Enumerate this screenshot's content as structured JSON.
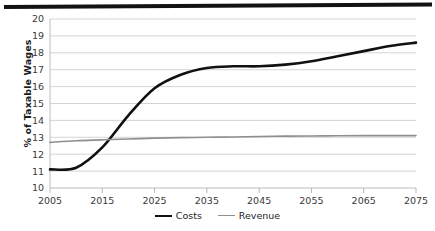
{
  "chart_data": {
    "type": "line",
    "title": "",
    "xlabel": "",
    "ylabel": "% of Taxable Wages",
    "xlim": [
      2005,
      2075
    ],
    "ylim": [
      10,
      20
    ],
    "ytick_step": 1,
    "yticks": [
      "20",
      "19",
      "18",
      "17",
      "16",
      "15",
      "14",
      "13",
      "12",
      "11",
      "10"
    ],
    "xticks": [
      "2005",
      "2015",
      "2025",
      "2035",
      "2045",
      "2055",
      "2065",
      "2075"
    ],
    "grid": "horizontal",
    "legend_position": "bottom-center",
    "x": [
      2005,
      2010,
      2015,
      2020,
      2025,
      2030,
      2035,
      2040,
      2045,
      2050,
      2055,
      2060,
      2065,
      2070,
      2075
    ],
    "series": [
      {
        "name": "Costs",
        "color": "#111111",
        "width": 2.6,
        "values": [
          11.1,
          11.2,
          12.4,
          14.3,
          15.9,
          16.7,
          17.1,
          17.2,
          17.2,
          17.3,
          17.5,
          17.8,
          18.1,
          18.4,
          18.6
        ]
      },
      {
        "name": "Revenue",
        "color": "#8f8f8f",
        "width": 1.6,
        "values": [
          12.7,
          12.8,
          12.85,
          12.9,
          12.95,
          12.98,
          13.0,
          13.02,
          13.05,
          13.07,
          13.08,
          13.09,
          13.1,
          13.1,
          13.1
        ]
      }
    ]
  },
  "legend": {
    "items": [
      {
        "label": "Costs"
      },
      {
        "label": "Revenue"
      }
    ]
  },
  "axes": {
    "y_title": "% of Taxable Wages"
  }
}
